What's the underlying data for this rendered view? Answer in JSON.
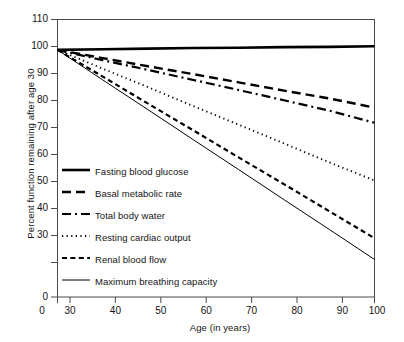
{
  "chart_data": {
    "type": "line",
    "title": "",
    "xlabel": "Age (in years)",
    "ylabel": "Percent function remaining after age 30",
    "xlim": [
      30,
      100
    ],
    "ylim": [
      30,
      110
    ],
    "xticks": [
      "0",
      "30",
      "40",
      "50",
      "60",
      "70",
      "80",
      "90",
      "100"
    ],
    "yticks": [
      "0",
      "30",
      "40",
      "50",
      "60",
      "70",
      "80",
      "90",
      "100",
      "110"
    ],
    "grid": false,
    "legend_position": "inside-lower-left",
    "x": [
      30,
      40,
      50,
      60,
      70,
      80,
      90,
      100
    ],
    "series": [
      {
        "name": "Fasting blood glucose",
        "style": "solid-thick",
        "color": "#000000",
        "values": [
          100,
          100.2,
          100.4,
          100.6,
          100.7,
          100.9,
          101.0,
          101.2
        ]
      },
      {
        "name": "Basal metabolic rate",
        "style": "dashed-long",
        "color": "#000000",
        "values": [
          100,
          97.3,
          94.6,
          92.0,
          89.3,
          86.6,
          84.0,
          81.0
        ]
      },
      {
        "name": "Total body water",
        "style": "dash-dot",
        "color": "#000000",
        "values": [
          100,
          96.6,
          93.4,
          90.1,
          86.8,
          83.4,
          80.0,
          76.0
        ]
      },
      {
        "name": "Resting cardiac output",
        "style": "dotted",
        "color": "#000000",
        "values": [
          100,
          93.8,
          87.7,
          81.5,
          75.4,
          69.2,
          63.0,
          57.0
        ]
      },
      {
        "name": "Renal blood flow",
        "style": "dashed-short",
        "color": "#000000",
        "values": [
          100,
          91.2,
          82.3,
          73.5,
          64.6,
          55.8,
          46.9,
          38.0
        ]
      },
      {
        "name": "Maximum breathing capacity",
        "style": "solid-thin",
        "color": "#000000",
        "values": [
          100,
          90.1,
          80.3,
          70.4,
          60.6,
          50.7,
          40.9,
          31.0
        ]
      }
    ]
  },
  "legend": {
    "items": [
      {
        "label": "Fasting blood glucose"
      },
      {
        "label": "Basal metabolic rate"
      },
      {
        "label": "Total body water"
      },
      {
        "label": "Resting cardiac output"
      },
      {
        "label": "Renal blood flow"
      },
      {
        "label": "Maximum breathing capacity"
      }
    ]
  }
}
